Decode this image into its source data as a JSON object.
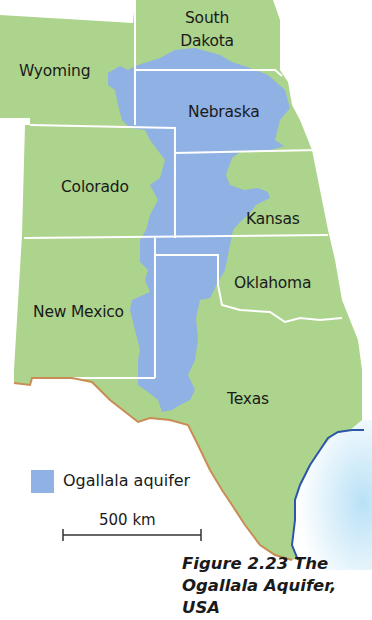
{
  "map": {
    "colors": {
      "land": "#acd48c",
      "aquifer": "#8fb1e3",
      "state_border": "#ffffff",
      "mexico_border": "#c98c55",
      "coastline": "#2c56a8",
      "gulf_water": "#cfe9f7"
    },
    "states": [
      {
        "name": "South Dakota",
        "line1": "South",
        "line2": "Dakota"
      },
      {
        "name": "Wyoming"
      },
      {
        "name": "Nebraska"
      },
      {
        "name": "Colorado"
      },
      {
        "name": "Kansas"
      },
      {
        "name": "Oklahoma"
      },
      {
        "name": "New Mexico"
      },
      {
        "name": "Texas"
      }
    ]
  },
  "legend": {
    "aquifer_label": "Ogallala aquifer",
    "aquifer_color": "#8fb1e3"
  },
  "scale_bar": {
    "label": "500 km"
  },
  "caption": {
    "line1": "Figure 2.23 The",
    "line2": "Ogallala Aquifer,",
    "line3": "USA"
  }
}
